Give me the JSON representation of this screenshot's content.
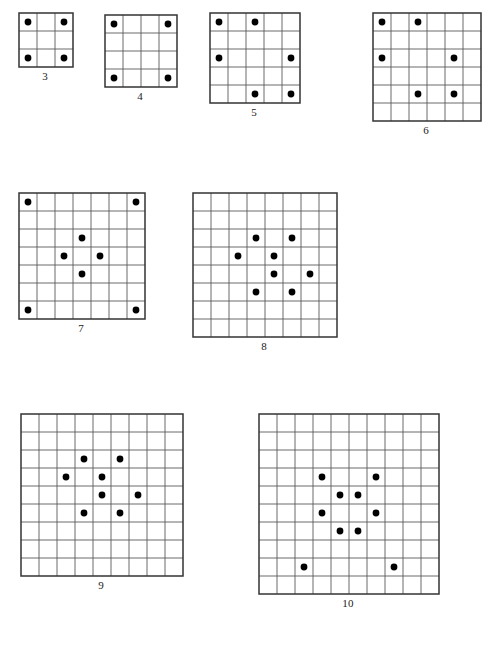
{
  "page": {
    "background_color": "#ffffff",
    "grid_line_color": "#5a5a5a",
    "border_color": "#333333",
    "dot_color": "#000000",
    "label_color": "#1a1a1a",
    "width": 486,
    "height": 654
  },
  "figures": [
    {
      "id": "figure-3",
      "label": "3",
      "size": 3,
      "cell": 18,
      "x": 18,
      "y": 12,
      "dots": [
        [
          0,
          0
        ],
        [
          0,
          2
        ],
        [
          2,
          0
        ],
        [
          2,
          2
        ]
      ],
      "dot_count": 4
    },
    {
      "id": "figure-4",
      "label": "4",
      "size": 4,
      "cell": 18,
      "x": 104,
      "y": 14,
      "dots": [
        [
          0,
          0
        ],
        [
          0,
          3
        ],
        [
          3,
          0
        ],
        [
          3,
          3
        ]
      ],
      "dot_count": 4
    },
    {
      "id": "figure-5",
      "label": "5",
      "size": 5,
      "cell": 18,
      "x": 209,
      "y": 12,
      "dots": [
        [
          0,
          0
        ],
        [
          0,
          2
        ],
        [
          2,
          0
        ],
        [
          2,
          4
        ],
        [
          4,
          2
        ],
        [
          4,
          4
        ]
      ],
      "dot_count": 6
    },
    {
      "id": "figure-6",
      "label": "6",
      "size": 6,
      "cell": 18,
      "x": 372,
      "y": 12,
      "dots": [
        [
          0,
          0
        ],
        [
          0,
          2
        ],
        [
          2,
          0
        ],
        [
          2,
          4
        ],
        [
          4,
          2
        ],
        [
          4,
          4
        ]
      ],
      "dot_count": 6
    },
    {
      "id": "figure-7",
      "label": "7",
      "size": 7,
      "cell": 18,
      "x": 18,
      "y": 192,
      "dots": [
        [
          0,
          0
        ],
        [
          0,
          6
        ],
        [
          2,
          3
        ],
        [
          3,
          2
        ],
        [
          3,
          4
        ],
        [
          4,
          3
        ],
        [
          6,
          0
        ],
        [
          6,
          6
        ]
      ],
      "dot_count": 8
    },
    {
      "id": "figure-8",
      "label": "8",
      "size": 8,
      "cell": 18,
      "x": 192,
      "y": 192,
      "dots": [
        [
          2,
          3
        ],
        [
          2,
          5
        ],
        [
          3,
          2
        ],
        [
          3,
          4
        ],
        [
          4,
          4
        ],
        [
          4,
          6
        ],
        [
          5,
          3
        ],
        [
          5,
          5
        ]
      ],
      "dot_count": 8
    },
    {
      "id": "figure-9",
      "label": "9",
      "size": 9,
      "cell": 18,
      "x": 20,
      "y": 413,
      "dots": [
        [
          2,
          3
        ],
        [
          2,
          5
        ],
        [
          3,
          2
        ],
        [
          3,
          4
        ],
        [
          4,
          4
        ],
        [
          4,
          6
        ],
        [
          5,
          3
        ],
        [
          5,
          5
        ]
      ],
      "dot_count": 8
    },
    {
      "id": "figure-10",
      "label": "10",
      "size": 10,
      "cell": 18,
      "x": 258,
      "y": 413,
      "dots": [
        [
          3,
          3
        ],
        [
          3,
          6
        ],
        [
          4,
          4
        ],
        [
          4,
          5
        ],
        [
          5,
          3
        ],
        [
          5,
          6
        ],
        [
          6,
          4
        ],
        [
          6,
          5
        ],
        [
          8,
          2
        ],
        [
          8,
          7
        ]
      ],
      "dot_count": 10
    }
  ]
}
